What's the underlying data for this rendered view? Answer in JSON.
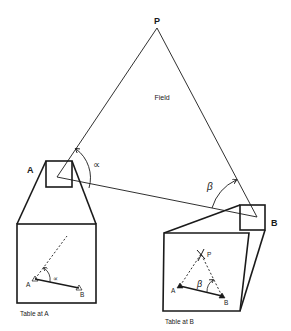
{
  "diagram": {
    "field_label": "Field",
    "points": {
      "P": "P",
      "A": "A",
      "B": "B"
    },
    "angles": {
      "alpha": "∝",
      "beta": "β"
    },
    "inset_A": {
      "caption": "Table at A",
      "point_A": "A",
      "point_B": "B",
      "angle": "∝"
    },
    "inset_B": {
      "caption": "Table at B",
      "point_A": "A",
      "point_B": "B",
      "point_P": "P",
      "angle": "β"
    },
    "colors": {
      "line": "#1a1a1a",
      "background": "#ffffff"
    }
  }
}
